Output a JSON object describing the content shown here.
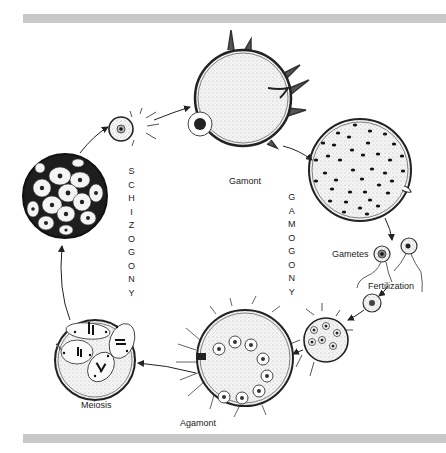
{
  "figure": {
    "labels": {
      "gamont": "Gamont",
      "gametes": "Gametes",
      "fertilization": "Fertilization",
      "agamont": "Agamont",
      "meiosis": "Meiosis"
    },
    "phases": {
      "schizogony": [
        "S",
        "C",
        "H",
        "I",
        "Z",
        "O",
        "G",
        "O",
        "N",
        "Y"
      ],
      "gamogony": [
        "G",
        "A",
        "M",
        "O",
        "G",
        "O",
        "N",
        "Y"
      ]
    },
    "colors": {
      "rule": "#c8c8c8",
      "ink": "#1a1a1a",
      "cell_fill": "#efefef",
      "dark_fill": "#2a2a2a"
    }
  }
}
